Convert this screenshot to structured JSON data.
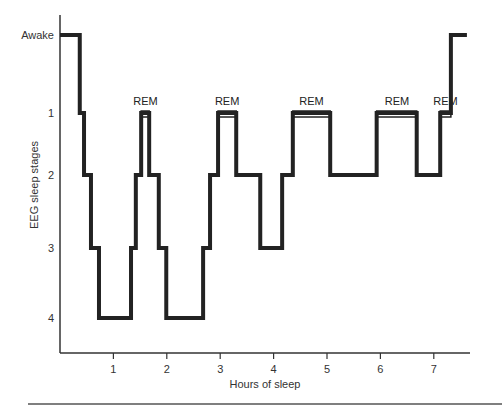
{
  "chart_data": {
    "type": "line",
    "subtype": "step (hypnogram)",
    "title": "",
    "xlabel": "Hours of sleep",
    "ylabel": "EEG sleep stages",
    "x_ticks": [
      1,
      2,
      3,
      4,
      5,
      6,
      7
    ],
    "y_categories": [
      "Awake",
      "1",
      "2",
      "3",
      "4"
    ],
    "xlim": [
      0,
      7.8
    ],
    "grid": false,
    "legend": null,
    "series": [
      {
        "name": "Sleep stage",
        "steps": [
          {
            "start": 0.0,
            "end": 0.37,
            "stage": "Awake"
          },
          {
            "start": 0.37,
            "end": 0.45,
            "stage": "1"
          },
          {
            "start": 0.45,
            "end": 0.58,
            "stage": "2"
          },
          {
            "start": 0.58,
            "end": 0.73,
            "stage": "3"
          },
          {
            "start": 0.73,
            "end": 1.33,
            "stage": "4"
          },
          {
            "start": 1.33,
            "end": 1.42,
            "stage": "3"
          },
          {
            "start": 1.42,
            "end": 1.52,
            "stage": "2"
          },
          {
            "start": 1.52,
            "end": 1.67,
            "stage": "1",
            "rem": true
          },
          {
            "start": 1.67,
            "end": 1.85,
            "stage": "2"
          },
          {
            "start": 1.85,
            "end": 1.99,
            "stage": "3"
          },
          {
            "start": 1.99,
            "end": 2.68,
            "stage": "4"
          },
          {
            "start": 2.68,
            "end": 2.81,
            "stage": "3"
          },
          {
            "start": 2.81,
            "end": 2.96,
            "stage": "2"
          },
          {
            "start": 2.96,
            "end": 3.3,
            "stage": "1",
            "rem": true
          },
          {
            "start": 3.3,
            "end": 3.75,
            "stage": "2"
          },
          {
            "start": 3.75,
            "end": 4.16,
            "stage": "3"
          },
          {
            "start": 4.16,
            "end": 4.36,
            "stage": "2"
          },
          {
            "start": 4.36,
            "end": 5.06,
            "stage": "1",
            "rem": true
          },
          {
            "start": 5.06,
            "end": 5.93,
            "stage": "2"
          },
          {
            "start": 5.93,
            "end": 6.68,
            "stage": "1",
            "rem": true
          },
          {
            "start": 6.68,
            "end": 7.12,
            "stage": "2"
          },
          {
            "start": 7.12,
            "end": 7.32,
            "stage": "1",
            "rem": true
          },
          {
            "start": 7.32,
            "end": 7.62,
            "stage": "Awake"
          }
        ]
      }
    ],
    "annotations": [
      {
        "text": "REM",
        "x": 1.6
      },
      {
        "text": "REM",
        "x": 3.13
      },
      {
        "text": "REM",
        "x": 4.71
      },
      {
        "text": "REM",
        "x": 6.31
      },
      {
        "text": "REM",
        "x": 7.22
      }
    ]
  },
  "layout": {
    "plot_left": 60,
    "plot_right": 470,
    "plot_top": 15,
    "plot_bottom": 353,
    "x_px_per_hour": 53.4,
    "y_px": {
      "Awake": 35,
      "1": 113,
      "2": 175,
      "3": 248,
      "4": 318
    },
    "line_color": "#222222",
    "axis_color": "#333333",
    "rem_fill": "#ffffff"
  }
}
